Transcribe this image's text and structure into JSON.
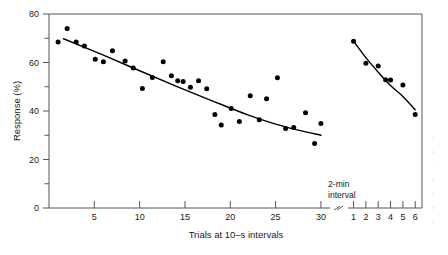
{
  "chart_data": {
    "type": "scatter",
    "title": "",
    "xlabel": "Trials at 10–s intervals",
    "ylabel": "Response (%)",
    "xlim": [
      0,
      31
    ],
    "ylim": [
      0,
      80
    ],
    "yticks": [
      0,
      20,
      40,
      60,
      80
    ],
    "ytick_labels": [
      "0",
      "20",
      "40",
      "60",
      "80"
    ],
    "yminor_ticks": [
      10,
      30,
      50,
      70
    ],
    "xticks": [
      5,
      10,
      15,
      20,
      25,
      30
    ],
    "xtick_labels": [
      "5",
      "10",
      "15",
      "20",
      "25",
      "30"
    ],
    "grid": false,
    "legend": null,
    "axis_break": true,
    "annotations": [
      {
        "name": "interval-note",
        "line1": "2-min",
        "line2": "interval"
      }
    ],
    "segments": [
      {
        "name": "pre-interval",
        "xlim": [
          1,
          30
        ],
        "xticks": [
          5,
          10,
          15,
          20,
          25,
          30
        ],
        "points": [
          {
            "x": 1.0,
            "y": 68.5
          },
          {
            "x": 2.0,
            "y": 74.0
          },
          {
            "x": 3.0,
            "y": 68.5
          },
          {
            "x": 3.9,
            "y": 66.8
          },
          {
            "x": 5.1,
            "y": 61.3
          },
          {
            "x": 6.0,
            "y": 60.3
          },
          {
            "x": 7.0,
            "y": 64.8
          },
          {
            "x": 8.4,
            "y": 60.6
          },
          {
            "x": 9.3,
            "y": 57.7
          },
          {
            "x": 10.3,
            "y": 49.3
          },
          {
            "x": 11.4,
            "y": 53.8
          },
          {
            "x": 12.6,
            "y": 60.3
          },
          {
            "x": 13.5,
            "y": 54.5
          },
          {
            "x": 14.2,
            "y": 52.5
          },
          {
            "x": 14.8,
            "y": 52.2
          },
          {
            "x": 15.6,
            "y": 49.8
          },
          {
            "x": 16.5,
            "y": 52.5
          },
          {
            "x": 17.4,
            "y": 49.2
          },
          {
            "x": 18.3,
            "y": 38.6
          },
          {
            "x": 19.0,
            "y": 34.2
          },
          {
            "x": 20.1,
            "y": 41.0
          },
          {
            "x": 21.0,
            "y": 35.7
          },
          {
            "x": 22.2,
            "y": 46.3
          },
          {
            "x": 23.2,
            "y": 36.4
          },
          {
            "x": 24.0,
            "y": 45.1
          },
          {
            "x": 25.2,
            "y": 53.7
          },
          {
            "x": 26.1,
            "y": 32.8
          },
          {
            "x": 27.0,
            "y": 33.2
          },
          {
            "x": 28.3,
            "y": 39.3
          },
          {
            "x": 29.3,
            "y": 26.6
          },
          {
            "x": 30.0,
            "y": 34.8
          }
        ],
        "fit_curve": [
          {
            "x": 1.6,
            "y": 69.8
          },
          {
            "x": 6.0,
            "y": 63.0
          },
          {
            "x": 10.0,
            "y": 56.6
          },
          {
            "x": 14.0,
            "y": 50.3
          },
          {
            "x": 18.0,
            "y": 44.2
          },
          {
            "x": 22.0,
            "y": 38.3
          },
          {
            "x": 25.0,
            "y": 34.6
          },
          {
            "x": 27.5,
            "y": 32.1
          },
          {
            "x": 30.0,
            "y": 30.0
          }
        ]
      },
      {
        "name": "post-interval",
        "xticks": [
          1,
          2,
          3,
          4,
          5,
          6
        ],
        "xtick_labels": [
          "1",
          "2",
          "3",
          "4",
          "5",
          "6"
        ],
        "points": [
          {
            "x": 1.0,
            "y": 68.8
          },
          {
            "x": 2.0,
            "y": 59.7
          },
          {
            "x": 3.0,
            "y": 58.6
          },
          {
            "x": 3.6,
            "y": 52.9
          },
          {
            "x": 4.0,
            "y": 52.8
          },
          {
            "x": 5.0,
            "y": 50.7
          },
          {
            "x": 6.0,
            "y": 38.6
          }
        ],
        "fit_curve": [
          {
            "x": 1.0,
            "y": 68.8
          },
          {
            "x": 2.0,
            "y": 62.0
          },
          {
            "x": 3.0,
            "y": 56.0
          },
          {
            "x": 4.0,
            "y": 50.5
          },
          {
            "x": 5.0,
            "y": 46.0
          },
          {
            "x": 6.0,
            "y": 40.5
          }
        ]
      }
    ]
  },
  "style": {
    "axis_color": "#555555",
    "point_color": "#000000",
    "curve_color": "#000000",
    "background": "#ffffff"
  },
  "edge_fragments": [
    "|",
    "s",
    "·",
    "e",
    "l",
    "T",
    "n"
  ]
}
